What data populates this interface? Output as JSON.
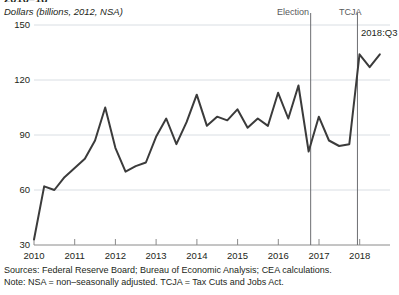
{
  "chart": {
    "title": "2010–18",
    "subtitle": "Dollars (billions, 2012, NSA)"
  },
  "annotations": {
    "election": "Election",
    "tcja": "TCJA",
    "last_point": "2018:Q3"
  },
  "footnotes": {
    "sources": "Sources: Federal Reserve Board; Bureau of Economic Analysis; CEA calculations.",
    "note": "Note: NSA = non–seasonally adjusted. TCJA = Tax Cuts and Jobs Act."
  },
  "colors": {
    "line": "#3b3b3b",
    "grid": "#d9dee3",
    "axis": "#7a7a7a",
    "vline": "#6d6e71",
    "text": "#231f20",
    "annotation_text": "#58595b",
    "background": "#ffffff"
  },
  "chart_data": {
    "type": "line",
    "title": "2010–18",
    "subtitle": "Dollars (billions, 2012, NSA)",
    "xlabel": "",
    "ylabel": "Dollars (billions, 2012, NSA)",
    "ylim": [
      30,
      150
    ],
    "yticks": [
      30,
      60,
      90,
      120,
      150
    ],
    "xlim": [
      2010.0,
      2018.75
    ],
    "xticks": [
      2010,
      2011,
      2012,
      2013,
      2014,
      2015,
      2016,
      2017,
      2018
    ],
    "grid": true,
    "legend": null,
    "series": [
      {
        "name": "Real private fixed investment (repatriation-related)",
        "x": [
          2010.0,
          2010.25,
          2010.5,
          2010.75,
          2011.0,
          2011.25,
          2011.5,
          2011.75,
          2012.0,
          2012.25,
          2012.5,
          2012.75,
          2013.0,
          2013.25,
          2013.5,
          2013.75,
          2014.0,
          2014.25,
          2014.5,
          2014.75,
          2015.0,
          2015.25,
          2015.5,
          2015.75,
          2016.0,
          2016.25,
          2016.5,
          2016.75,
          2017.0,
          2017.25,
          2017.5,
          2017.75,
          2018.0,
          2018.25,
          2018.5
        ],
        "values": [
          33,
          62,
          60,
          67,
          72,
          77,
          87,
          105,
          83,
          70,
          73,
          75,
          89,
          99,
          85,
          97,
          112,
          95,
          100,
          98,
          104,
          94,
          99,
          95,
          113,
          99,
          117,
          81,
          100,
          87,
          84,
          85,
          134,
          127,
          134
        ]
      }
    ],
    "vertical_lines": [
      {
        "label": "Election",
        "x": 2016.8
      },
      {
        "label": "TCJA",
        "x": 2017.95
      }
    ],
    "point_labels": [
      {
        "label": "2018:Q3",
        "x": 2018.5,
        "value": 134
      }
    ]
  }
}
